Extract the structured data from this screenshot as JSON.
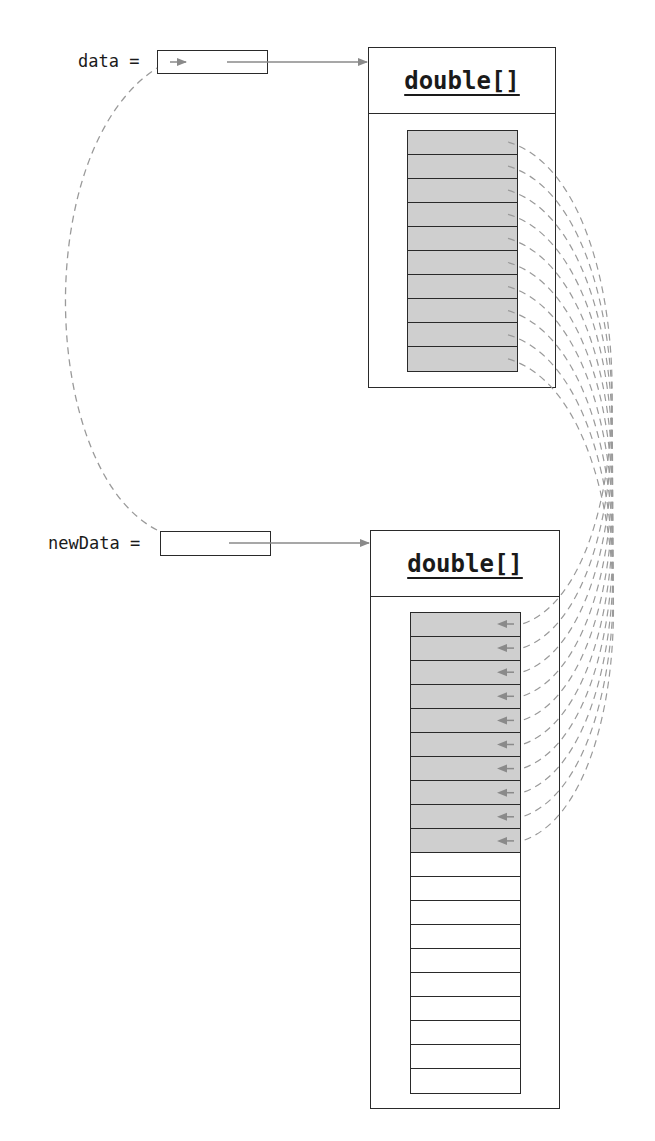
{
  "diagram": {
    "type": "array-resize-copy",
    "variables": [
      {
        "name": "data",
        "label": "data ="
      },
      {
        "name": "newData",
        "label": "newData ="
      }
    ],
    "objects": [
      {
        "id": "old_array",
        "type_label": "double[]",
        "length": 10,
        "filled_cells": 10
      },
      {
        "id": "new_array",
        "type_label": "double[]",
        "length": 20,
        "filled_cells": 10
      }
    ],
    "connections": {
      "data_to_old_array": "solid arrow",
      "newData_to_new_array": "solid arrow",
      "newData_reference_copied_to_data": "dashed curved arrow",
      "element_copies": 10
    },
    "colors": {
      "stroke": "#2a2a2a",
      "filled_cell": "#cfcfcf",
      "arrow": "#8a8a8a",
      "dashed": "#9a9a9a"
    }
  }
}
